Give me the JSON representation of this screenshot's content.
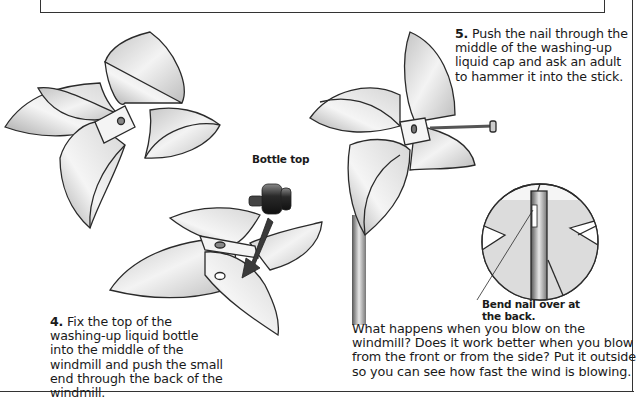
{
  "step5": {
    "number": "5.",
    "text": " Push the nail through the middle of the washing-up liquid cap and ask an adult to hammer it into the stick."
  },
  "step4": {
    "number": "4.",
    "text": " Fix the top of the washing-up liquid bottle into the middle of the windmill and push the small end through the back of the windmill."
  },
  "labels": {
    "bottle_top": "Bottle top",
    "bend_nail": "Bend nail over at the back."
  },
  "question": {
    "text": "What happens when you blow on the windmill? Does it work better when you blow from the front or from the side? Put it outside so you can see how fast the wind is blowing."
  },
  "colors": {
    "outline": "#2a2a2a",
    "paper_light": "#f2f2f2",
    "paper_shade": "#b8b8b8",
    "arrow": "#3a3a3a"
  }
}
